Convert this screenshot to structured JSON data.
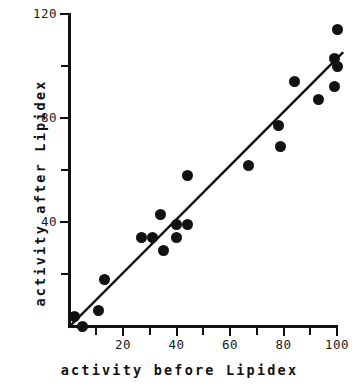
{
  "chart_data": {
    "type": "scatter",
    "title": "",
    "xlabel": "activity before Lipidex",
    "ylabel": "activity after Lipidex",
    "xlim": [
      0,
      102
    ],
    "ylim": [
      0,
      120
    ],
    "grid": false,
    "legend": null,
    "x_ticks_major": [
      20,
      40,
      60,
      80,
      100
    ],
    "x_ticks_minor": [
      10,
      30,
      50,
      70,
      90
    ],
    "y_ticks_major": [
      40,
      80,
      120
    ],
    "y_ticks_minor": [
      20,
      60,
      100
    ],
    "x_tick_labels": [
      "20",
      "40",
      "60",
      "80",
      "100"
    ],
    "y_tick_labels": [
      "40",
      "80",
      "120"
    ],
    "points": [
      {
        "x": 2,
        "y": 4
      },
      {
        "x": 5,
        "y": 0
      },
      {
        "x": 11,
        "y": 6
      },
      {
        "x": 13,
        "y": 18
      },
      {
        "x": 27,
        "y": 34
      },
      {
        "x": 31,
        "y": 34
      },
      {
        "x": 34,
        "y": 43
      },
      {
        "x": 35,
        "y": 29
      },
      {
        "x": 40,
        "y": 34
      },
      {
        "x": 40,
        "y": 39
      },
      {
        "x": 44,
        "y": 39
      },
      {
        "x": 44,
        "y": 58
      },
      {
        "x": 67,
        "y": 62
      },
      {
        "x": 78,
        "y": 77
      },
      {
        "x": 79,
        "y": 69
      },
      {
        "x": 84,
        "y": 94
      },
      {
        "x": 93,
        "y": 87
      },
      {
        "x": 99,
        "y": 92
      },
      {
        "x": 99,
        "y": 103
      },
      {
        "x": 100,
        "y": 100
      },
      {
        "x": 100,
        "y": 114
      }
    ],
    "fit_line": {
      "type": "linear-regression",
      "x_start": 0,
      "y_start": 0,
      "x_end": 102,
      "y_end": 105
    },
    "colors": {
      "marker": "#111111",
      "line": "#111111",
      "axis": "#111111",
      "background": "#ffffff"
    }
  }
}
